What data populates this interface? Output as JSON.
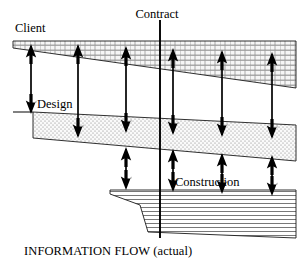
{
  "figure": {
    "caption": "INFORMATION FLOW (actual)",
    "labels": {
      "client": "Client",
      "design": "Design",
      "construction": "Construction",
      "contract": "Contract"
    },
    "colors": {
      "stroke": "#000000",
      "background": "#ffffff",
      "client_fill": "#efefef",
      "design_fill": "#f2f2f2",
      "construction_fill": "#ffffff"
    },
    "bands": [
      {
        "name": "client",
        "label": "Client",
        "pattern": "brick",
        "points": "13,41 296,41 296,88 13,48"
      },
      {
        "name": "design",
        "label": "Design",
        "pattern": "stipple",
        "points": "33,112 296,125 296,161 33,138"
      },
      {
        "name": "construction",
        "label": "Construction",
        "pattern": "horizontal-lines",
        "points": "110,190 296,190 296,238 148,232 140,205 110,194"
      }
    ],
    "contract_line": {
      "x": 160,
      "y_top": 20,
      "y_bottom": 238
    },
    "arrow_columns": [
      31,
      78,
      126,
      173,
      222,
      272
    ]
  }
}
